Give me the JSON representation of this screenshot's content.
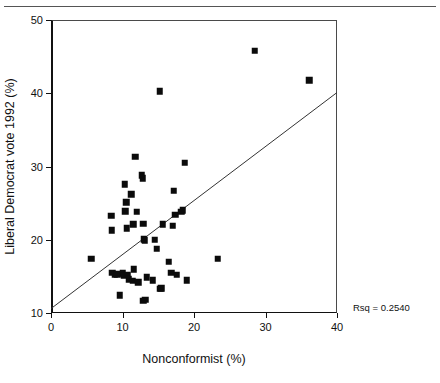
{
  "chart_data": {
    "type": "scatter",
    "title": "",
    "xlabel": "Nonconformist (%)",
    "ylabel": "Liberal Democrat vote 1992 (%)",
    "xlim": [
      0,
      40
    ],
    "ylim": [
      10,
      50
    ],
    "xticks": [
      0,
      10,
      20,
      30,
      40
    ],
    "yticks": [
      10,
      20,
      30,
      40,
      50
    ],
    "xtick_labels": [
      "0",
      "10",
      "20",
      "30",
      "40"
    ],
    "ytick_labels": [
      "10",
      "20",
      "30",
      "40",
      "50"
    ],
    "grid": false,
    "legend": null,
    "annotations": [
      {
        "text": "Rsq = 0.2540",
        "position": "bottom-right-outside"
      }
    ],
    "marker": {
      "shape": "square",
      "color": "#0b0b0b",
      "size": 6.5
    },
    "fit_line": {
      "type": "linear-regression",
      "color": "#333333",
      "x_start": 0.0,
      "y_start": 10.6,
      "x_end": 40.0,
      "y_end": 40.1
    },
    "series": [
      {
        "name": "constituencies",
        "points": [
          [
            5.6,
            17.4
          ],
          [
            8.4,
            23.3
          ],
          [
            8.5,
            21.3
          ],
          [
            8.6,
            15.5
          ],
          [
            8.9,
            15.2
          ],
          [
            9.3,
            15.3
          ],
          [
            9.6,
            12.4
          ],
          [
            10.0,
            15.4
          ],
          [
            10.2,
            15.1
          ],
          [
            10.3,
            27.6
          ],
          [
            10.4,
            23.9
          ],
          [
            10.5,
            25.1
          ],
          [
            10.6,
            21.6
          ],
          [
            10.7,
            15.2
          ],
          [
            10.9,
            14.6
          ],
          [
            11.2,
            26.2
          ],
          [
            11.4,
            14.4
          ],
          [
            11.5,
            22.1
          ],
          [
            11.6,
            16.0
          ],
          [
            11.8,
            31.3
          ],
          [
            12.0,
            23.8
          ],
          [
            12.2,
            14.2
          ],
          [
            12.7,
            28.8
          ],
          [
            12.8,
            28.4
          ],
          [
            12.9,
            22.2
          ],
          [
            12.9,
            11.7
          ],
          [
            13.0,
            20.1
          ],
          [
            13.1,
            19.9
          ],
          [
            13.2,
            11.8
          ],
          [
            13.4,
            14.9
          ],
          [
            14.2,
            14.5
          ],
          [
            14.5,
            20.0
          ],
          [
            14.8,
            18.8
          ],
          [
            15.2,
            40.3
          ],
          [
            15.3,
            13.3
          ],
          [
            15.4,
            13.4
          ],
          [
            15.6,
            22.1
          ],
          [
            16.5,
            17.0
          ],
          [
            16.8,
            15.5
          ],
          [
            17.0,
            21.9
          ],
          [
            17.2,
            26.7
          ],
          [
            17.4,
            23.4
          ],
          [
            17.6,
            15.2
          ],
          [
            18.2,
            23.8
          ],
          [
            18.4,
            24.0
          ],
          [
            18.7,
            30.5
          ],
          [
            19.0,
            14.5
          ],
          [
            23.3,
            17.4
          ],
          [
            28.5,
            45.8
          ],
          [
            36.1,
            41.8
          ]
        ]
      }
    ]
  }
}
